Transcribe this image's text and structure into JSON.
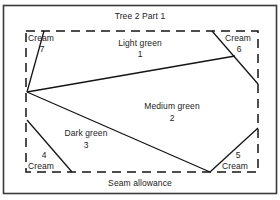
{
  "title": "Tree 2 Part 1",
  "footer_label": "Seam allowance",
  "colors": {
    "ink": "#1b1b1b",
    "frame": "#3a3a3a",
    "line": "#141414",
    "background": "#ffffff"
  },
  "regions": [
    {
      "id": "region-1",
      "name": "Light green",
      "number": "1"
    },
    {
      "id": "region-2",
      "name": "Medium green",
      "number": "2"
    },
    {
      "id": "region-3",
      "name": "Dark green",
      "number": "3"
    },
    {
      "id": "region-4",
      "name": "Cream",
      "number": "4"
    },
    {
      "id": "region-5",
      "name": "Cream",
      "number": "5"
    },
    {
      "id": "region-6",
      "name": "Cream",
      "number": "6"
    },
    {
      "id": "region-7",
      "name": "Cream",
      "number": "7"
    }
  ]
}
